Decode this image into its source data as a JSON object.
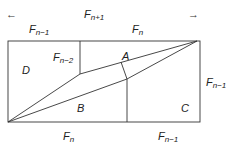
{
  "diagram": {
    "arrows": {
      "left": "←",
      "right": "→"
    },
    "top_labels": {
      "total": {
        "base": "F",
        "sub": "n+1"
      },
      "left_part": {
        "base": "F",
        "sub": "n−1"
      },
      "right_part": {
        "base": "F",
        "sub": "n"
      }
    },
    "inner_label": {
      "base": "F",
      "sub": "n−2"
    },
    "right_label": {
      "base": "F",
      "sub": "n−1"
    },
    "bottom_labels": {
      "left_part": {
        "base": "F",
        "sub": "n"
      },
      "right_part": {
        "base": "F",
        "sub": "n−1"
      }
    },
    "regions": {
      "a": "A",
      "b": "B",
      "c": "C",
      "d": "D"
    },
    "line_color": "#333333"
  }
}
